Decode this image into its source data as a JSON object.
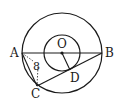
{
  "diagram": {
    "type": "geometry",
    "points": {
      "A": {
        "label": "A",
        "x": 22,
        "y": 53
      },
      "B": {
        "label": "B",
        "x": 102,
        "y": 53
      },
      "O": {
        "label": "O",
        "x": 62,
        "y": 53
      },
      "C": {
        "label": "C",
        "x": 37,
        "y": 86
      },
      "D": {
        "label": "D",
        "x": 70,
        "y": 70
      }
    },
    "circles": [
      {
        "name": "outer-circle",
        "cx": 62,
        "cy": 53,
        "r": 40
      },
      {
        "name": "inner-circle",
        "cx": 62,
        "cy": 53,
        "r": 18
      }
    ],
    "measurement": {
      "label": "8"
    },
    "colors": {
      "stroke": "#1a1a1a",
      "background": "#ffffff"
    }
  }
}
